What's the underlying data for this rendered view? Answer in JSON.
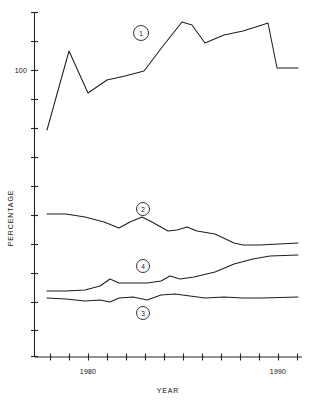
{
  "chart_data": {
    "type": "line",
    "title": "",
    "xlabel": "YEAR",
    "ylabel": "PERCENTAGE",
    "grid": false,
    "legend": "inline-numbered-markers",
    "xlim": [
      1976,
      1992
    ],
    "ylim": [
      0,
      160
    ],
    "x_ticks": [
      1976,
      1977,
      1978,
      1979,
      1980,
      1981,
      1982,
      1983,
      1984,
      1985,
      1986,
      1987,
      1988,
      1989,
      1990,
      1991,
      1992
    ],
    "x_tick_labels": [
      "",
      "",
      "",
      "",
      "1980",
      "",
      "",
      "",
      "",
      "",
      "",
      "",
      "",
      "",
      "1990",
      "",
      ""
    ],
    "y_ticks": [
      0,
      20,
      40,
      60,
      80,
      100,
      120,
      140,
      160
    ],
    "y_tick_labels": [
      "0",
      "",
      "",
      "",
      "",
      "100",
      "",
      "",
      ""
    ],
    "y_axis_label_value": "100",
    "x_axis_label_low": "1980",
    "x_axis_label_high": "1990",
    "series": [
      {
        "name": "1",
        "marker_label": "1",
        "x": [
          1977,
          1978,
          1979,
          1980,
          1981,
          1982,
          1983,
          1984,
          1985,
          1986,
          1987,
          1988,
          1989,
          1990,
          1991,
          1992
        ],
        "values": [
          62,
          110,
          104,
          89,
          98,
          99,
          101,
          113,
          128,
          136,
          134,
          128,
          125,
          130,
          135,
          105
        ]
      },
      {
        "name": "2",
        "marker_label": "2",
        "x": [
          1977,
          1978,
          1979,
          1980,
          1981,
          1982,
          1983,
          1984,
          1985,
          1986,
          1987,
          1988,
          1989,
          1990,
          1991,
          1992
        ],
        "values": [
          52,
          52,
          51,
          49,
          46,
          44,
          46,
          45,
          42,
          41,
          43,
          41,
          39,
          35,
          33,
          33
        ]
      },
      {
        "name": "3",
        "marker_label": "3",
        "x": [
          1977,
          1978,
          1979,
          1980,
          1981,
          1982,
          1983,
          1984,
          1985,
          1986,
          1987,
          1988,
          1989,
          1990,
          1991,
          1992
        ],
        "values": [
          17,
          17,
          16,
          16,
          18,
          17,
          18,
          19,
          18,
          18,
          18,
          18,
          18,
          18,
          18,
          18
        ]
      },
      {
        "name": "4",
        "marker_label": "4",
        "x": [
          1977,
          1978,
          1979,
          1980,
          1981,
          1982,
          1983,
          1984,
          1985,
          1986,
          1987,
          1988,
          1989,
          1990,
          1991,
          1992
        ],
        "values": [
          21,
          21,
          21,
          23,
          26,
          24,
          24,
          26,
          25,
          27,
          29,
          31,
          33,
          35,
          36,
          36
        ]
      }
    ],
    "markers": [
      {
        "label": "1",
        "x_px": 141,
        "y_px": 33
      },
      {
        "label": "2",
        "x_px": 143,
        "y_px": 209
      },
      {
        "label": "4",
        "x_px": 143,
        "y_px": 266
      },
      {
        "label": "3",
        "x_px": 143,
        "y_px": 313
      }
    ],
    "series_paths_px": {
      "s1": "47,130 69,51 88,93 107,80 125,76 144,71 163,46 182,22 192,25 205,43 224,35 243,31 262,25 268,23 277,68 298,68",
      "s2": "47,214 66,214 85,217 104,222 119,228 130,222 142,217 152,222 168,231 177,230 187,227 197,231 215,234 234,243 243,245 260,245 298,243",
      "s3": "47,298 66,299 85,301 100,300 110,302 119,298 133,297 147,300 161,295 175,294 190,296 205,298 224,297 243,298 262,298 298,297",
      "s4": "47,291 66,291 85,290 100,286 110,279 119,283 133,283 147,283 161,281 170,276 180,279 194,277 215,272 234,264 253,259 270,256 298,255"
    }
  }
}
